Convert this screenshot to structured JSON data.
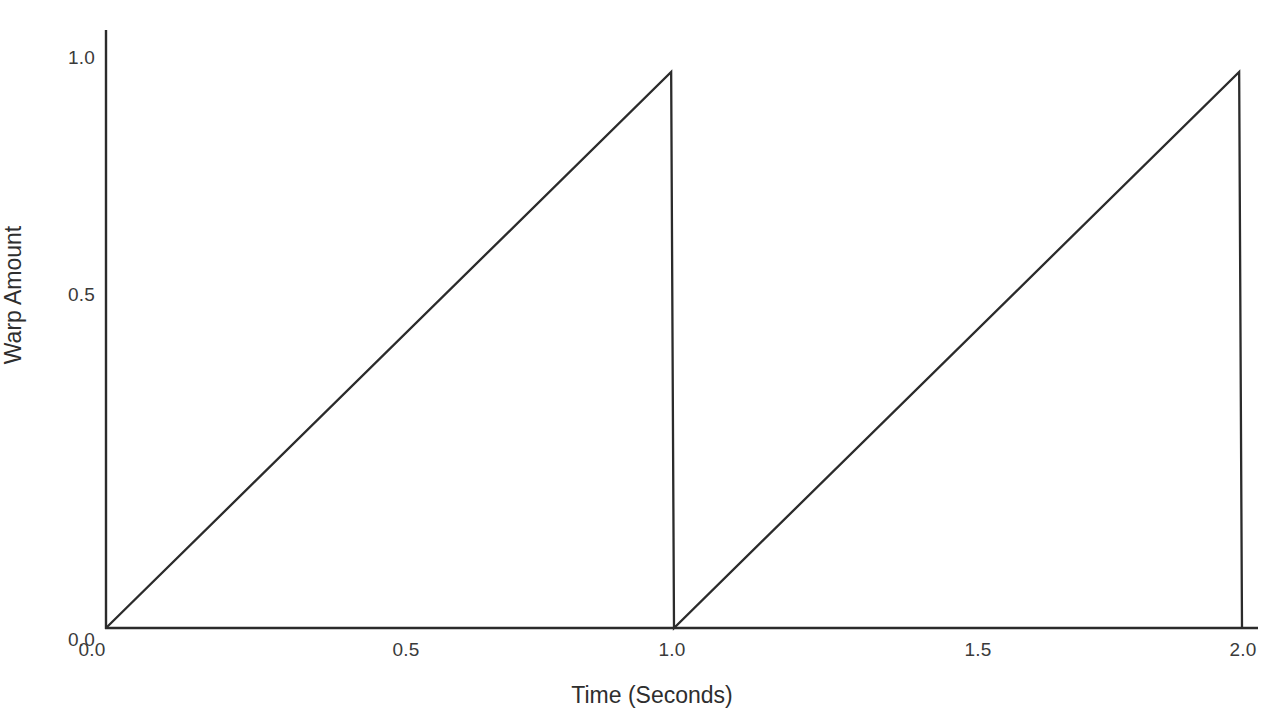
{
  "chart_data": {
    "type": "line",
    "title": "",
    "subtitle": "",
    "xlabel": "Time (Seconds)",
    "ylabel": "Warp Amount",
    "xlim": [
      0.0,
      2.03
    ],
    "ylim": [
      0.0,
      1.05
    ],
    "xticks": [
      0.0,
      0.5,
      1.0,
      1.5,
      2.0
    ],
    "xtick_labels": [
      "0.0",
      "0.5",
      "1.0",
      "1.5",
      "2.0"
    ],
    "yticks": [
      0.0,
      0.5,
      1.0
    ],
    "ytick_labels": [
      "0.0",
      "0.5",
      "1.0"
    ],
    "grid": false,
    "legend": false,
    "legend_position": "none",
    "line_color": "#2b2b2b",
    "line_width": 2,
    "background_color": "#ffffff",
    "series": [
      {
        "name": "Warp Amount",
        "description": "Sawtooth ramp, two cycles of period 1 second",
        "x": [
          0.0,
          0.995,
          1.0,
          1.995,
          2.0
        ],
        "y": [
          0.0,
          0.98,
          0.0,
          0.98,
          0.0
        ]
      }
    ],
    "annotations": []
  },
  "axes": {
    "x_title": "Time (Seconds)",
    "y_title": "Warp Amount",
    "x_tick_labels": [
      "0.0",
      "0.5",
      "1.0",
      "1.5",
      "2.0"
    ],
    "y_tick_labels": [
      "1.0",
      "0.5",
      "0.0"
    ]
  }
}
